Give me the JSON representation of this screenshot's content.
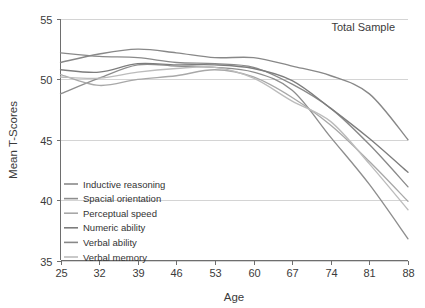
{
  "chart_data": {
    "type": "line",
    "title": "",
    "annotation": "Total Sample",
    "xlabel": "Age",
    "ylabel": "Mean T-Scores",
    "x": [
      25,
      32,
      39,
      46,
      53,
      60,
      67,
      74,
      81,
      88
    ],
    "xtick_labels": [
      "25",
      "32",
      "39",
      "46",
      "53",
      "60",
      "67",
      "74",
      "81",
      "88"
    ],
    "ytick_labels": [
      "35",
      "40",
      "45",
      "50",
      "55"
    ],
    "yticks": [
      35,
      40,
      45,
      50,
      55
    ],
    "xlim": [
      25,
      88
    ],
    "ylim": [
      35,
      55
    ],
    "grid": "horizontal",
    "legend_position": "inside-lower-left",
    "series": [
      {
        "name": "Inductive reasoning",
        "color": "#8a8a8a",
        "values": [
          52.2,
          51.9,
          51.8,
          51.4,
          51.3,
          51.0,
          49.6,
          47.6,
          44.6,
          41.1
        ]
      },
      {
        "name": "Spacial orientation",
        "color": "#8e8e8e",
        "values": [
          48.8,
          50.1,
          51.2,
          51.1,
          51.0,
          50.6,
          49.1,
          45.2,
          41.3,
          36.8
        ]
      },
      {
        "name": "Perceptual speed",
        "color": "#a8a8a8",
        "values": [
          50.4,
          49.5,
          50.0,
          50.3,
          50.8,
          50.2,
          48.5,
          46.2,
          43.2,
          39.9
        ]
      },
      {
        "name": "Numeric ability",
        "color": "#7d7d7d",
        "values": [
          50.8,
          50.6,
          51.3,
          51.2,
          51.2,
          50.9,
          49.9,
          47.6,
          45.1,
          42.3
        ]
      },
      {
        "name": "Verbal ability",
        "color": "#888888",
        "values": [
          51.4,
          52.1,
          52.5,
          52.2,
          51.8,
          51.8,
          51.1,
          50.3,
          48.8,
          45.0
        ]
      },
      {
        "name": "Verbal memory",
        "color": "#bcbcbc",
        "values": [
          50.2,
          50.1,
          50.6,
          50.9,
          51.0,
          50.1,
          48.2,
          46.5,
          43.0,
          39.2
        ]
      }
    ]
  }
}
